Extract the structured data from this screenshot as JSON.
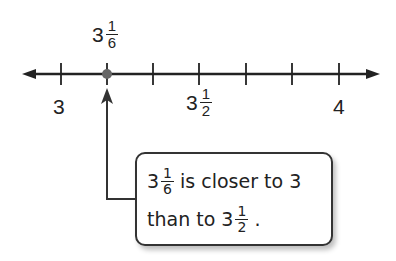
{
  "number_line": {
    "min_label": "3",
    "max_label": "4",
    "mid_label": {
      "whole": "3",
      "num": "1",
      "den": "2"
    },
    "point_label": {
      "whole": "3",
      "num": "1",
      "den": "6"
    },
    "ticks": 7,
    "point_value": "3 1/6"
  },
  "callout": {
    "line1": {
      "whole": "3",
      "num": "1",
      "den": "6",
      "text": " is closer to 3"
    },
    "line2": {
      "prefix": "than to ",
      "whole": "3",
      "num": "1",
      "den": "2",
      "suffix": " ."
    }
  },
  "colors": {
    "line": "#222222",
    "point": "#666666"
  }
}
